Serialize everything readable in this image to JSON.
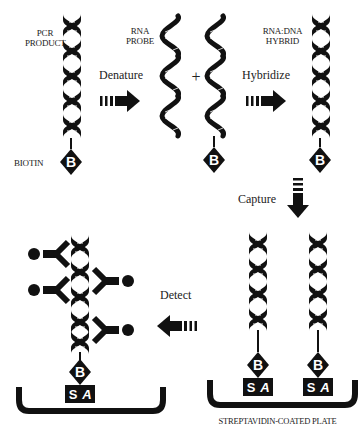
{
  "labels": {
    "pcr_product": [
      "PCR",
      "PRODUCT"
    ],
    "biotin": "BIOTIN",
    "rna_probe": [
      "RNA",
      "PROBE"
    ],
    "rna_dna_hybrid": [
      "RNA:DNA",
      "HYBRID"
    ],
    "plate": "STREPTAVIDIN-COATED PLATE",
    "plus": "+"
  },
  "steps": [
    {
      "label": "Denature",
      "direction": "right"
    },
    {
      "label": "Hybridize",
      "direction": "right"
    },
    {
      "label": "Capture",
      "direction": "down"
    },
    {
      "label": "Detect",
      "direction": "left"
    }
  ],
  "glyphs": {
    "biotin": "B",
    "streptavidin_s": "S",
    "streptavidin_a": "A"
  },
  "colors": {
    "ink": "#111111",
    "background": "#ffffff"
  }
}
